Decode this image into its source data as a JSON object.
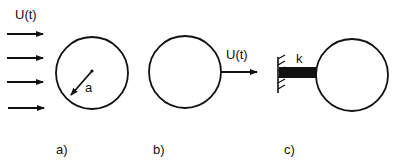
{
  "figure": {
    "panels": [
      {
        "id": "a",
        "caption": "a)",
        "flow_label": "U(t)",
        "radius_label": "a"
      },
      {
        "id": "b",
        "caption": "b)",
        "velocity_label": "U(t)"
      },
      {
        "id": "c",
        "caption": "c)",
        "spring_label": "k"
      }
    ],
    "colors": {
      "ink": "#111111",
      "background": "#ffffff"
    }
  }
}
